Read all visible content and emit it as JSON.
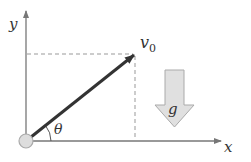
{
  "diagram": {
    "axes": {
      "x_label": "x",
      "y_label": "y"
    },
    "velocity": {
      "label_main": "v",
      "label_sub": "0"
    },
    "angle": {
      "label": "θ"
    },
    "gravity": {
      "label": "g"
    },
    "colors": {
      "axis": "#777777",
      "velocity_vector": "#333333",
      "dashed_guides": "#999999",
      "gravity_fill": "#e0e0e0",
      "gravity_stroke": "#aaaaaa",
      "origin_fill": "#dddddd",
      "origin_stroke": "#aaaaaa"
    }
  }
}
